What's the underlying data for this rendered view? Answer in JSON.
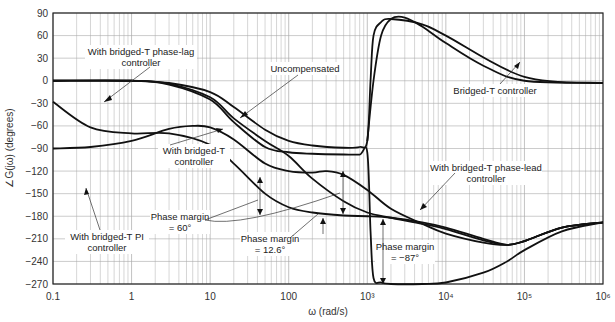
{
  "chart_data": {
    "type": "line",
    "title": "",
    "xlabel": "ω (rad/s)",
    "ylabel": "∠G(jω) (degrees)",
    "xscale": "log",
    "xlim": [
      0.1,
      1000000
    ],
    "ylim": [
      -270,
      90
    ],
    "grid": true,
    "x_tick_labels": [
      "0.1",
      "1",
      "10",
      "100",
      "10³",
      "10⁴",
      "10⁵",
      "10⁶"
    ],
    "y_tick_labels": [
      "90",
      "60",
      "30",
      "0",
      "−30",
      "−60",
      "−90",
      "−120",
      "−150",
      "−180",
      "−210",
      "−240",
      "−270"
    ],
    "series": [
      {
        "name": "Uncompensated",
        "x": [
          0.1,
          1,
          3,
          10,
          20,
          50,
          100,
          200,
          500,
          800,
          1000,
          1100,
          1200,
          1500,
          2000,
          5000,
          10000,
          100000,
          1000000
        ],
        "y": [
          0,
          0,
          -3,
          -15,
          -35,
          -65,
          -80,
          -86,
          -89,
          -88,
          -80,
          0,
          60,
          78,
          82,
          75,
          60,
          5,
          -3
        ]
      },
      {
        "name": "Bridged-T controller",
        "x": [
          1000,
          1200,
          1500,
          2000,
          3000,
          5000,
          10000,
          30000,
          100000,
          1000000
        ],
        "y": [
          -80,
          0,
          60,
          82,
          84,
          72,
          50,
          20,
          0,
          -3
        ]
      },
      {
        "name": "With bridged-T controller",
        "x": [
          0.1,
          1,
          3,
          10,
          20,
          50,
          100,
          200,
          500,
          800,
          1000,
          1100,
          1200,
          1500,
          2000,
          5000,
          10000,
          30000,
          60000,
          100000,
          300000,
          1000000
        ],
        "y": [
          0,
          0,
          -5,
          -25,
          -55,
          -88,
          -95,
          -97,
          -98,
          -98,
          -95,
          -200,
          -262,
          -268,
          -270,
          -270,
          -268,
          -255,
          -240,
          -225,
          -200,
          -188
        ]
      },
      {
        "name": "With bridged-T phase-lag controller",
        "x": [
          0.1,
          0.3,
          1,
          3,
          10,
          20,
          50,
          100,
          200,
          500,
          1000,
          2000,
          5000,
          10000,
          30000,
          60000,
          100000,
          300000,
          1000000
        ],
        "y": [
          -28,
          -62,
          -70,
          -70,
          -85,
          -110,
          -150,
          -168,
          -175,
          -179,
          -180,
          -182,
          -188,
          -195,
          -210,
          -218,
          -213,
          -195,
          -188
        ]
      },
      {
        "name": "With bridged-T PI controller",
        "x": [
          0.1,
          0.3,
          1,
          3,
          6,
          10,
          20,
          50,
          100,
          200,
          300,
          500,
          1000,
          2000,
          5000,
          10000,
          30000,
          60000,
          100000,
          300000,
          1000000
        ],
        "y": [
          -90,
          -88,
          -80,
          -64,
          -60,
          -62,
          -78,
          -110,
          -120,
          -122,
          -120,
          -125,
          -145,
          -170,
          -190,
          -203,
          -215,
          -218,
          -213,
          -195,
          -188
        ]
      },
      {
        "name": "With bridged-T phase-lead controller",
        "x": [
          0.1,
          1,
          3,
          10,
          20,
          50,
          100,
          200,
          500,
          1000,
          2000,
          5000,
          10000,
          30000,
          60000,
          100000,
          300000,
          1000000
        ],
        "y": [
          0,
          0,
          -4,
          -22,
          -50,
          -80,
          -100,
          -130,
          -160,
          -175,
          -182,
          -190,
          -197,
          -212,
          -218,
          -213,
          -195,
          -188
        ]
      }
    ],
    "annotations": [
      {
        "text": "With bridged-T phase-lag controller",
        "lines": [
          "With bridged-T phase-lag",
          "controller"
        ]
      },
      {
        "text": "Uncompensated",
        "lines": [
          "Uncompensated"
        ]
      },
      {
        "text": "Bridged-T controller",
        "lines": [
          "Bridged-T controller"
        ]
      },
      {
        "text": "With bridged-T controller",
        "lines": [
          "With bridged-T",
          "controller"
        ]
      },
      {
        "text": "With bridged-T phase-lead controller",
        "lines": [
          "With bridged-T phase-lead",
          "controller"
        ]
      },
      {
        "text": "With bridged-T PI controller",
        "lines": [
          "With bridged-T PI",
          "controller"
        ]
      },
      {
        "text": "Phase margin = 60°",
        "lines": [
          "Phase margin",
          "= 60°"
        ]
      },
      {
        "text": "Phase margin = 12.6°",
        "lines": [
          "Phase margin",
          "= 12.6°"
        ]
      },
      {
        "text": "Phase margin = −87°",
        "lines": [
          "Phase margin",
          "= −87°"
        ]
      }
    ],
    "legend": "none (inline annotations)"
  }
}
